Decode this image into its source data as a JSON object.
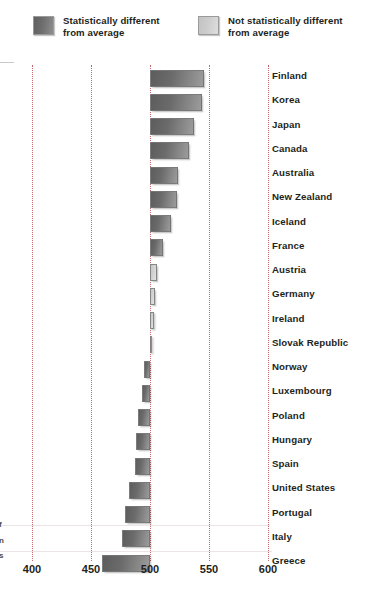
{
  "legend": {
    "items": [
      {
        "label_line1": "Statistically different",
        "label_line2": "from average",
        "swatch": "dark-gray-swatch",
        "color": "#6b6b6b"
      },
      {
        "label_line1": "Not statistically different",
        "label_line2": "from average",
        "swatch": "light-gray-swatch",
        "color": "#d0d0d0"
      }
    ]
  },
  "xaxis": {
    "ticks": [
      "400",
      "450",
      "500",
      "550",
      "600"
    ],
    "tick_values": [
      400,
      450,
      500,
      550,
      600
    ]
  },
  "edge_fragments": [
    "f",
    "n",
    "s"
  ],
  "chart_data": {
    "type": "bar",
    "orientation": "horizontal",
    "title": "",
    "xlabel": "",
    "ylabel": "",
    "xlim": [
      383,
      610
    ],
    "baseline": 500,
    "grid": true,
    "gridlines": [
      400,
      450,
      500,
      550,
      600
    ],
    "legend_position": "top",
    "categories": [
      "Finland",
      "Korea",
      "Japan",
      "Canada",
      "Australia",
      "New Zealand",
      "Iceland",
      "France",
      "Austria",
      "Germany",
      "Ireland",
      "Slovak Republic",
      "Norway",
      "Luxembourg",
      "Poland",
      "Hungary",
      "Spain",
      "United States",
      "Portugal",
      "Italy",
      "Greece"
    ],
    "values": [
      546,
      544,
      537,
      533,
      524,
      523,
      518,
      511,
      506,
      504,
      503,
      501,
      495,
      493,
      490,
      488,
      487,
      482,
      479,
      476,
      459
    ],
    "significance": [
      "significant",
      "significant",
      "significant",
      "significant",
      "significant",
      "significant",
      "significant",
      "significant",
      "not-significant",
      "not-significant",
      "not-significant",
      "not-significant",
      "significant",
      "significant",
      "significant",
      "significant",
      "significant",
      "significant",
      "significant",
      "significant",
      "significant"
    ]
  }
}
